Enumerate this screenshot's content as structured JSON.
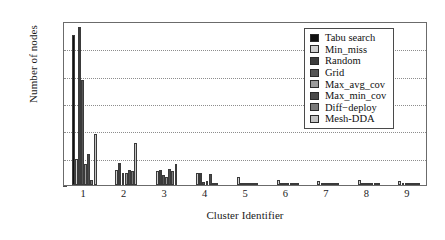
{
  "chart_data": {
    "type": "bar",
    "title": "",
    "xlabel": "Cluster Identifier",
    "ylabel": "Number of nodes",
    "categories": [
      "1",
      "2",
      "3",
      "4",
      "5",
      "6",
      "7",
      "8",
      "9"
    ],
    "ylim": [
      0,
      300
    ],
    "yticks": [
      0,
      50,
      100,
      150,
      200,
      250,
      300
    ],
    "grid": true,
    "legend_position": "upper right",
    "series": [
      {
        "name": "Tabu search",
        "color": "#101010",
        "values": [
          275,
          0,
          0,
          0,
          0,
          0,
          0,
          0,
          0
        ]
      },
      {
        "name": "Min_miss",
        "color": "#d0d0d0",
        "values": [
          48,
          28,
          26,
          22,
          14,
          10,
          8,
          9,
          8
        ]
      },
      {
        "name": "Random",
        "color": "#3d3d3d",
        "values": [
          289,
          40,
          28,
          22,
          3,
          3,
          3,
          3,
          3
        ]
      },
      {
        "name": "Grid",
        "color": "#565656",
        "values": [
          192,
          22,
          19,
          6,
          3,
          2,
          2,
          2,
          2
        ]
      },
      {
        "name": "Max_avg_cov",
        "color": "#9a9a9a",
        "values": [
          39,
          22,
          15,
          7,
          2,
          2,
          2,
          2,
          2
        ]
      },
      {
        "name": "Max_min_cov",
        "color": "#4a4a4a",
        "values": [
          57,
          27,
          29,
          21,
          3,
          2,
          2,
          2,
          2
        ]
      },
      {
        "name": "Diff-deploy",
        "color": "#7a7a7a",
        "values": [
          10,
          26,
          25,
          4,
          2,
          2,
          2,
          2,
          2
        ]
      },
      {
        "name": "Mesh-DDA",
        "color": "#c4c4c4",
        "values": [
          93,
          76,
          38,
          3,
          2,
          2,
          2,
          2,
          2
        ]
      }
    ]
  },
  "legend": {
    "items": [
      {
        "label": "Tabu search"
      },
      {
        "label": "Min_miss"
      },
      {
        "label": "Random"
      },
      {
        "label": "Grid"
      },
      {
        "label": "Max_avg_cov"
      },
      {
        "label": "Max_min_cov"
      },
      {
        "label": "Diff−deploy"
      },
      {
        "label": "Mesh-DDA"
      }
    ]
  }
}
